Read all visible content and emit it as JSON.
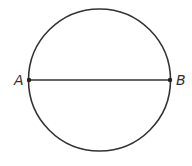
{
  "diagram": {
    "type": "circle-with-diameter",
    "circle": {
      "cx": 99.5,
      "cy": 80,
      "r": 71,
      "stroke": "#333333"
    },
    "diameter": {
      "from": "A",
      "to": "B"
    },
    "points": [
      {
        "label": "A",
        "x": 29,
        "y": 80
      },
      {
        "label": "B",
        "x": 170,
        "y": 80
      }
    ],
    "labels": {
      "a": "A",
      "b": "B"
    }
  }
}
